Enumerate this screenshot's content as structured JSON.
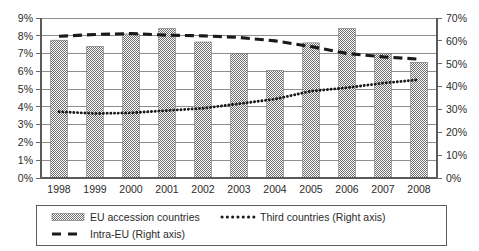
{
  "chart_data": {
    "type": "bar",
    "title": "",
    "xlabel": "",
    "ylabel": "",
    "categories": [
      "1998",
      "1999",
      "2000",
      "2001",
      "2002",
      "2003",
      "2004",
      "2005",
      "2006",
      "2007",
      "2008"
    ],
    "left_axis": {
      "ylim": [
        0,
        9
      ],
      "tick_labels": [
        "0%",
        "1%",
        "2%",
        "3%",
        "4%",
        "5%",
        "6%",
        "7%",
        "8%",
        "9%"
      ],
      "tick_values": [
        0,
        1,
        2,
        3,
        4,
        5,
        6,
        7,
        8,
        9
      ],
      "unit": "%"
    },
    "right_axis": {
      "ylim": [
        0,
        70
      ],
      "tick_labels": [
        "0%",
        "10%",
        "20%",
        "30%",
        "40%",
        "50%",
        "60%",
        "70%"
      ],
      "tick_values": [
        0,
        10,
        20,
        30,
        40,
        50,
        60,
        70
      ],
      "unit": "%"
    },
    "grid": true,
    "legend_position": "bottom",
    "series": [
      {
        "name": "EU accession countries",
        "type": "bar",
        "axis": "left",
        "color": "#808080",
        "pattern": "checker-hatch",
        "values": [
          7.75,
          7.4,
          8.1,
          8.4,
          7.65,
          7.0,
          6.05,
          7.6,
          8.4,
          7.0,
          6.5
        ]
      },
      {
        "name": "Third countries  (Right axis)",
        "type": "line",
        "axis": "right",
        "color": "#1a1a1a",
        "dash": "dotted",
        "values": [
          29,
          28.2,
          28.5,
          29.5,
          30.5,
          32.5,
          34.5,
          38,
          39.5,
          41.5,
          43
        ]
      },
      {
        "name": "Intra-EU (Right axis)",
        "type": "line",
        "axis": "right",
        "color": "#1a1a1a",
        "dash": "dashed",
        "values": [
          62,
          62.8,
          63.2,
          62.5,
          62.2,
          61.5,
          60,
          57.5,
          54.5,
          53,
          52
        ]
      }
    ]
  },
  "legend": {
    "items": [
      {
        "label": "EU accession countries",
        "marker": "bar-swatch-icon"
      },
      {
        "label": "Third countries  (Right axis)",
        "marker": "dotted-line-icon"
      },
      {
        "label": "Intra-EU (Right axis)",
        "marker": "dashed-line-icon"
      }
    ]
  }
}
